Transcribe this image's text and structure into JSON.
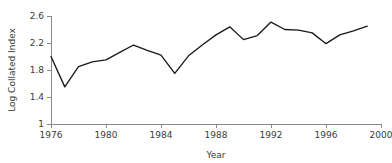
{
  "chart_data": {
    "type": "line",
    "title": "",
    "xlabel": "Year",
    "ylabel": "Log Collated Index",
    "xlim": [
      1976,
      2000
    ],
    "ylim": [
      1,
      2.6
    ],
    "grid": false,
    "legend": null,
    "x_ticks": [
      "1976",
      "1980",
      "1984",
      "1988",
      "1992",
      "1996",
      "2000"
    ],
    "x_tick_values": [
      1976,
      1980,
      1984,
      1988,
      1992,
      1996,
      2000
    ],
    "y_ticks": [
      "1",
      "1.4",
      "1.8",
      "2.2",
      "2.6"
    ],
    "y_tick_values": [
      1,
      1.4,
      1.8,
      2.2,
      2.6
    ],
    "line_color": "#1a1a1a",
    "axis_color": "#8a8a8a",
    "x": [
      1976,
      1977,
      1978,
      1979,
      1980,
      1981,
      1982,
      1983,
      1984,
      1985,
      1986,
      1987,
      1988,
      1989,
      1990,
      1991,
      1992,
      1993,
      1994,
      1995,
      1996,
      1997,
      1998,
      1999
    ],
    "values": [
      2.0,
      1.55,
      1.85,
      1.92,
      1.95,
      2.06,
      2.17,
      2.09,
      2.02,
      1.75,
      2.01,
      2.17,
      2.32,
      2.44,
      2.25,
      2.31,
      2.51,
      2.4,
      2.39,
      2.35,
      2.19,
      2.32,
      2.38,
      2.45
    ],
    "series": [
      {
        "name": "Log Collated Index",
        "values": [
          2.0,
          1.55,
          1.85,
          1.92,
          1.95,
          2.06,
          2.17,
          2.09,
          2.02,
          1.75,
          2.01,
          2.17,
          2.32,
          2.44,
          2.25,
          2.31,
          2.51,
          2.4,
          2.39,
          2.35,
          2.19,
          2.32,
          2.38,
          2.45
        ]
      }
    ]
  }
}
